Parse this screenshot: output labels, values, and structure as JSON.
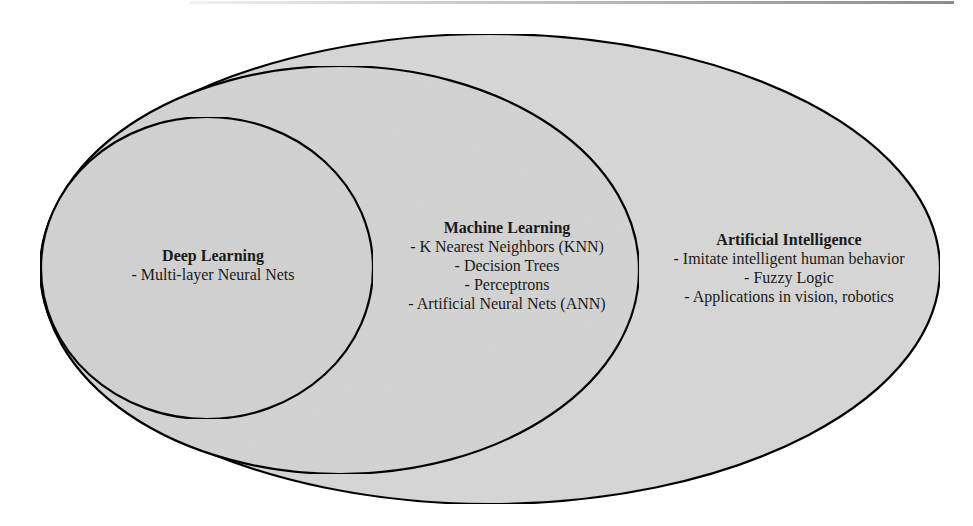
{
  "diagram": {
    "type": "nested-venn",
    "colors": {
      "fill": "#d9d9d9",
      "stroke": "#111111",
      "text": "#1a1a1a",
      "background": "#ffffff"
    },
    "sets": [
      {
        "id": "artificial-intelligence",
        "title": "Artificial Intelligence",
        "items": [
          "- Imitate intelligent human behavior",
          "- Fuzzy Logic",
          "- Applications in vision, robotics"
        ]
      },
      {
        "id": "machine-learning",
        "title": "Machine Learning",
        "items": [
          "- K Nearest Neighbors (KNN)",
          "- Decision Trees",
          "- Perceptrons",
          "- Artificial Neural Nets (ANN)"
        ]
      },
      {
        "id": "deep-learning",
        "title": "Deep Learning",
        "items": [
          "- Multi-layer Neural Nets"
        ]
      }
    ]
  }
}
